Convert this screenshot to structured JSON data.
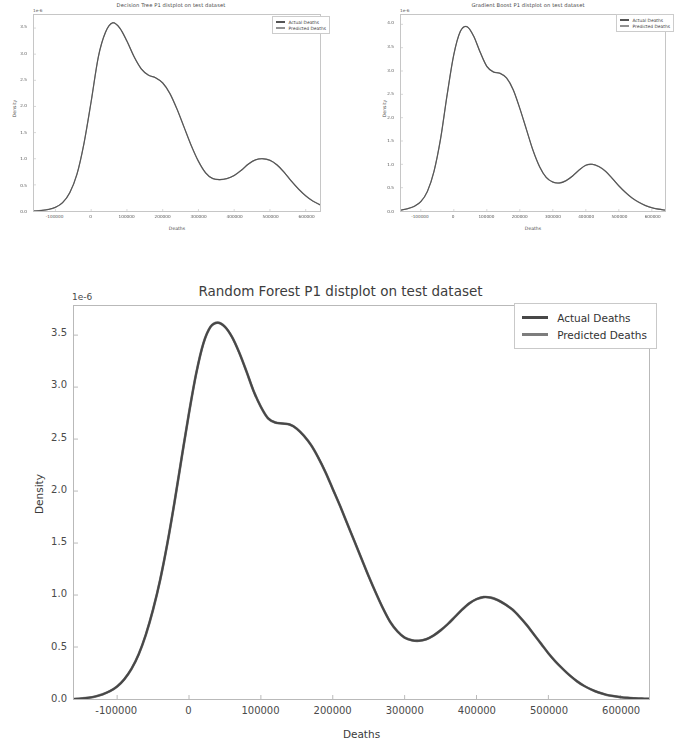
{
  "page": {
    "background": "#ffffff",
    "curve_color_actual": "#474747",
    "curve_color_predicted": "#6f6f6f",
    "axis_color": "#b9b9b9",
    "text_color": "#3a3a3a"
  },
  "figures": [
    {
      "id": "decision-tree",
      "title": "Decision Tree P1 distplot on test dataset",
      "xlabel": "Deaths",
      "ylabel": "Density",
      "offset_text": "1e-6",
      "legend": [
        {
          "label": "Actual Deaths",
          "color": "#474747"
        },
        {
          "label": "Predicted Deaths",
          "color": "#8a8a8a"
        }
      ],
      "yticks": [
        "0.0",
        "0.5",
        "1.0",
        "1.5",
        "2.0",
        "2.5",
        "3.0",
        "3.5"
      ],
      "xticks": [
        "-100000",
        "0",
        "100000",
        "200000",
        "300000",
        "400000",
        "500000",
        "600000"
      ]
    },
    {
      "id": "gradient-boost",
      "title": "Gradient Boost P1 distplot on test dataset",
      "xlabel": "Deaths",
      "ylabel": "Density",
      "offset_text": "1e-6",
      "legend": [
        {
          "label": "Actual Deaths",
          "color": "#474747"
        },
        {
          "label": "Predicted Deaths",
          "color": "#8a8a8a"
        }
      ],
      "yticks": [
        "0.0",
        "0.5",
        "1.0",
        "1.5",
        "2.0",
        "2.5",
        "3.0",
        "3.5",
        "4.0"
      ],
      "xticks": [
        "-100000",
        "0",
        "100000",
        "200000",
        "300000",
        "400000",
        "500000",
        "600000"
      ]
    },
    {
      "id": "random-forest",
      "title": "Random Forest P1 distplot on test dataset",
      "xlabel": "Deaths",
      "ylabel": "Density",
      "offset_text": "1e-6",
      "legend": [
        {
          "label": "Actual Deaths",
          "color": "#474747"
        },
        {
          "label": "Predicted Deaths",
          "color": "#7d7d7d"
        }
      ],
      "yticks": [
        "0.0",
        "0.5",
        "1.0",
        "1.5",
        "2.0",
        "2.5",
        "3.0",
        "3.5"
      ],
      "xticks": [
        "-100000",
        "0",
        "100000",
        "200000",
        "300000",
        "400000",
        "500000",
        "600000"
      ]
    }
  ],
  "chart_data": [
    {
      "type": "line",
      "id": "decision-tree",
      "title": "Decision Tree P1 distplot on test dataset",
      "xlabel": "Deaths",
      "ylabel": "Density",
      "y_multiplier": "1e-6",
      "xlim": [
        -160000,
        640000
      ],
      "ylim": [
        0.0,
        3.75
      ],
      "xticks": [
        -100000,
        0,
        100000,
        200000,
        300000,
        400000,
        500000,
        600000
      ],
      "yticks": [
        0.0,
        0.5,
        1.0,
        1.5,
        2.0,
        2.5,
        3.0,
        3.5
      ],
      "grid": false,
      "legend_position": "upper right",
      "series": [
        {
          "name": "Actual Deaths",
          "color": "#474747",
          "x": [
            -160000,
            -140000,
            -120000,
            -100000,
            -80000,
            -60000,
            -40000,
            -20000,
            0,
            20000,
            40000,
            60000,
            80000,
            100000,
            120000,
            140000,
            160000,
            180000,
            200000,
            220000,
            240000,
            260000,
            280000,
            300000,
            320000,
            340000,
            360000,
            380000,
            400000,
            420000,
            440000,
            460000,
            480000,
            500000,
            520000,
            540000,
            560000,
            580000,
            600000,
            620000,
            640000
          ],
          "y": [
            0.0,
            0.01,
            0.03,
            0.07,
            0.16,
            0.35,
            0.7,
            1.3,
            2.1,
            2.95,
            3.42,
            3.6,
            3.5,
            3.25,
            2.95,
            2.72,
            2.6,
            2.55,
            2.45,
            2.25,
            1.95,
            1.6,
            1.25,
            0.95,
            0.73,
            0.62,
            0.6,
            0.62,
            0.68,
            0.78,
            0.9,
            0.98,
            1.0,
            0.97,
            0.88,
            0.74,
            0.57,
            0.42,
            0.29,
            0.19,
            0.12
          ]
        },
        {
          "name": "Predicted Deaths",
          "color": "#8a8a8a",
          "x": [
            -160000,
            -140000,
            -120000,
            -100000,
            -80000,
            -60000,
            -40000,
            -20000,
            0,
            20000,
            40000,
            60000,
            80000,
            100000,
            120000,
            140000,
            160000,
            180000,
            200000,
            220000,
            240000,
            260000,
            280000,
            300000,
            320000,
            340000,
            360000,
            380000,
            400000,
            420000,
            440000,
            460000,
            480000,
            500000,
            520000,
            540000,
            560000,
            580000,
            600000,
            620000,
            640000
          ],
          "y": [
            0.0,
            0.01,
            0.03,
            0.07,
            0.16,
            0.35,
            0.7,
            1.3,
            2.1,
            2.95,
            3.42,
            3.6,
            3.5,
            3.25,
            2.95,
            2.72,
            2.6,
            2.55,
            2.45,
            2.25,
            1.95,
            1.6,
            1.25,
            0.95,
            0.73,
            0.62,
            0.6,
            0.62,
            0.68,
            0.78,
            0.9,
            0.98,
            1.0,
            0.97,
            0.88,
            0.74,
            0.57,
            0.42,
            0.29,
            0.19,
            0.12
          ]
        }
      ]
    },
    {
      "type": "line",
      "id": "gradient-boost",
      "title": "Gradient Boost P1 distplot on test dataset",
      "xlabel": "Deaths",
      "ylabel": "Density",
      "y_multiplier": "1e-6",
      "xlim": [
        -160000,
        640000
      ],
      "ylim": [
        0.0,
        4.2
      ],
      "xticks": [
        -100000,
        0,
        100000,
        200000,
        300000,
        400000,
        500000,
        600000
      ],
      "yticks": [
        0.0,
        0.5,
        1.0,
        1.5,
        2.0,
        2.5,
        3.0,
        3.5,
        4.0
      ],
      "grid": false,
      "legend_position": "upper right",
      "series": [
        {
          "name": "Actual Deaths",
          "color": "#474747",
          "x": [
            -160000,
            -140000,
            -120000,
            -100000,
            -80000,
            -60000,
            -40000,
            -20000,
            0,
            20000,
            40000,
            60000,
            80000,
            100000,
            120000,
            140000,
            160000,
            180000,
            200000,
            220000,
            240000,
            260000,
            280000,
            300000,
            320000,
            340000,
            360000,
            380000,
            400000,
            420000,
            440000,
            460000,
            480000,
            500000,
            520000,
            540000,
            560000,
            580000,
            600000,
            620000,
            640000
          ],
          "y": [
            0.02,
            0.05,
            0.1,
            0.2,
            0.42,
            0.85,
            1.55,
            2.5,
            3.35,
            3.85,
            3.95,
            3.75,
            3.4,
            3.1,
            2.98,
            2.95,
            2.85,
            2.6,
            2.2,
            1.75,
            1.3,
            0.95,
            0.72,
            0.62,
            0.6,
            0.65,
            0.75,
            0.88,
            0.98,
            1.0,
            0.95,
            0.85,
            0.7,
            0.54,
            0.4,
            0.28,
            0.19,
            0.12,
            0.07,
            0.04,
            0.02
          ]
        },
        {
          "name": "Predicted Deaths",
          "color": "#8a8a8a",
          "x": [
            -160000,
            -140000,
            -120000,
            -100000,
            -80000,
            -60000,
            -40000,
            -20000,
            0,
            20000,
            40000,
            60000,
            80000,
            100000,
            120000,
            140000,
            160000,
            180000,
            200000,
            220000,
            240000,
            260000,
            280000,
            300000,
            320000,
            340000,
            360000,
            380000,
            400000,
            420000,
            440000,
            460000,
            480000,
            500000,
            520000,
            540000,
            560000,
            580000,
            600000,
            620000,
            640000
          ],
          "y": [
            0.02,
            0.05,
            0.1,
            0.2,
            0.42,
            0.85,
            1.55,
            2.5,
            3.35,
            3.85,
            3.95,
            3.75,
            3.4,
            3.1,
            2.98,
            2.95,
            2.85,
            2.6,
            2.2,
            1.75,
            1.3,
            0.95,
            0.72,
            0.62,
            0.6,
            0.65,
            0.75,
            0.88,
            0.98,
            1.0,
            0.95,
            0.85,
            0.7,
            0.54,
            0.4,
            0.28,
            0.19,
            0.12,
            0.07,
            0.04,
            0.02
          ]
        }
      ]
    },
    {
      "type": "line",
      "id": "random-forest",
      "title": "Random Forest P1 distplot on test dataset",
      "xlabel": "Deaths",
      "ylabel": "Density",
      "y_multiplier": "1e-6",
      "xlim": [
        -160000,
        640000
      ],
      "ylim": [
        0.0,
        3.78
      ],
      "xticks": [
        -100000,
        0,
        100000,
        200000,
        300000,
        400000,
        500000,
        600000
      ],
      "yticks": [
        0.0,
        0.5,
        1.0,
        1.5,
        2.0,
        2.5,
        3.0,
        3.5
      ],
      "grid": false,
      "legend_position": "upper right",
      "series": [
        {
          "name": "Actual Deaths",
          "color": "#474747",
          "x": [
            -160000,
            -150000,
            -140000,
            -130000,
            -120000,
            -110000,
            -100000,
            -90000,
            -80000,
            -70000,
            -60000,
            -50000,
            -40000,
            -30000,
            -20000,
            -10000,
            0,
            10000,
            20000,
            30000,
            40000,
            50000,
            60000,
            70000,
            80000,
            90000,
            100000,
            110000,
            120000,
            130000,
            140000,
            150000,
            160000,
            170000,
            180000,
            190000,
            200000,
            210000,
            220000,
            230000,
            240000,
            250000,
            260000,
            270000,
            280000,
            290000,
            300000,
            310000,
            320000,
            330000,
            340000,
            350000,
            360000,
            370000,
            380000,
            390000,
            400000,
            410000,
            420000,
            430000,
            440000,
            450000,
            460000,
            470000,
            480000,
            490000,
            500000,
            510000,
            520000,
            530000,
            540000,
            550000,
            560000,
            570000,
            580000,
            590000,
            600000,
            610000,
            620000,
            630000,
            640000
          ],
          "y": [
            0.0,
            0.005,
            0.012,
            0.025,
            0.045,
            0.075,
            0.12,
            0.19,
            0.29,
            0.43,
            0.62,
            0.86,
            1.15,
            1.5,
            1.9,
            2.33,
            2.75,
            3.13,
            3.42,
            3.58,
            3.62,
            3.58,
            3.48,
            3.33,
            3.15,
            2.96,
            2.81,
            2.7,
            2.66,
            2.65,
            2.64,
            2.6,
            2.53,
            2.44,
            2.32,
            2.18,
            2.02,
            1.86,
            1.69,
            1.52,
            1.35,
            1.18,
            1.02,
            0.87,
            0.74,
            0.65,
            0.59,
            0.565,
            0.56,
            0.575,
            0.61,
            0.66,
            0.72,
            0.79,
            0.86,
            0.92,
            0.96,
            0.98,
            0.975,
            0.95,
            0.91,
            0.86,
            0.79,
            0.71,
            0.62,
            0.53,
            0.44,
            0.36,
            0.29,
            0.225,
            0.17,
            0.125,
            0.09,
            0.062,
            0.042,
            0.028,
            0.018,
            0.011,
            0.007,
            0.004,
            0.002
          ]
        },
        {
          "name": "Predicted Deaths",
          "color": "#7d7d7d",
          "x": [
            -160000,
            -150000,
            -140000,
            -130000,
            -120000,
            -110000,
            -100000,
            -90000,
            -80000,
            -70000,
            -60000,
            -50000,
            -40000,
            -30000,
            -20000,
            -10000,
            0,
            10000,
            20000,
            30000,
            40000,
            50000,
            60000,
            70000,
            80000,
            90000,
            100000,
            110000,
            120000,
            130000,
            140000,
            150000,
            160000,
            170000,
            180000,
            190000,
            200000,
            210000,
            220000,
            230000,
            240000,
            250000,
            260000,
            270000,
            280000,
            290000,
            300000,
            310000,
            320000,
            330000,
            340000,
            350000,
            360000,
            370000,
            380000,
            390000,
            400000,
            410000,
            420000,
            430000,
            440000,
            450000,
            460000,
            470000,
            480000,
            490000,
            500000,
            510000,
            520000,
            530000,
            540000,
            550000,
            560000,
            570000,
            580000,
            590000,
            600000,
            610000,
            620000,
            630000,
            640000
          ],
          "y": [
            0.0,
            0.005,
            0.012,
            0.025,
            0.045,
            0.075,
            0.12,
            0.19,
            0.29,
            0.43,
            0.62,
            0.86,
            1.15,
            1.5,
            1.9,
            2.33,
            2.75,
            3.13,
            3.42,
            3.58,
            3.62,
            3.58,
            3.48,
            3.33,
            3.15,
            2.96,
            2.81,
            2.7,
            2.66,
            2.65,
            2.64,
            2.6,
            2.53,
            2.44,
            2.32,
            2.18,
            2.02,
            1.86,
            1.69,
            1.52,
            1.35,
            1.18,
            1.02,
            0.87,
            0.74,
            0.65,
            0.59,
            0.565,
            0.56,
            0.575,
            0.61,
            0.66,
            0.72,
            0.79,
            0.86,
            0.92,
            0.96,
            0.98,
            0.975,
            0.95,
            0.91,
            0.86,
            0.79,
            0.71,
            0.62,
            0.53,
            0.44,
            0.36,
            0.29,
            0.225,
            0.17,
            0.125,
            0.09,
            0.062,
            0.042,
            0.028,
            0.018,
            0.011,
            0.007,
            0.004,
            0.002
          ]
        }
      ]
    }
  ]
}
